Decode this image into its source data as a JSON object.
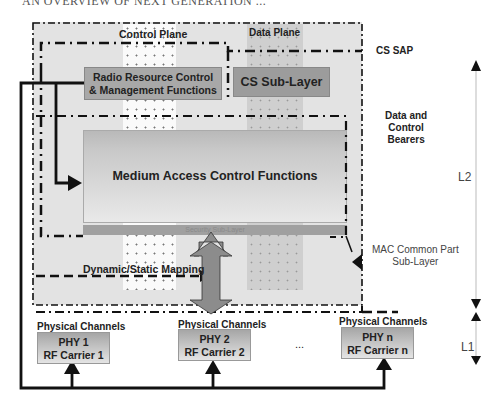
{
  "header": {
    "text": "AN OVERVIEW OF NEXT GENERATION ..."
  },
  "planes": {
    "control": "Control Plane",
    "data": "Data Plane"
  },
  "boxes": {
    "rrc_line1": "Radio Resource Control",
    "rrc_line2": "& Management Functions",
    "cs_sublayer": "CS Sub-Layer",
    "mac": "Medium Access Control Functions",
    "security": "Security Sub-Layer"
  },
  "labels": {
    "cs_sap": "CS SAP",
    "bearers_line1": "Data and",
    "bearers_line2": "Control",
    "bearers_line3": "Bearers",
    "mac_cps_line1": "MAC Common Part",
    "mac_cps_line2": "Sub-Layer",
    "mapping": "Dynamic/Static Mapping",
    "ellipsis": "..."
  },
  "layers": {
    "l2": "L2",
    "l1": "L1"
  },
  "phy": [
    {
      "channels": "Physical Channels",
      "line1": "PHY 1",
      "line2": "RF Carrier 1"
    },
    {
      "channels": "Physical Channels",
      "line1": "PHY 2",
      "line2": "RF Carrier 2"
    },
    {
      "channels": "Physical Channels",
      "line1": "PHY n",
      "line2": "RF Carrier n"
    }
  ],
  "colors": {
    "background": "#e2e2e2",
    "rrc_box": "#a8a8a8",
    "cs_box": "#9c9c9c",
    "big_arrow": "#8c8c8c",
    "line": "#111111"
  }
}
